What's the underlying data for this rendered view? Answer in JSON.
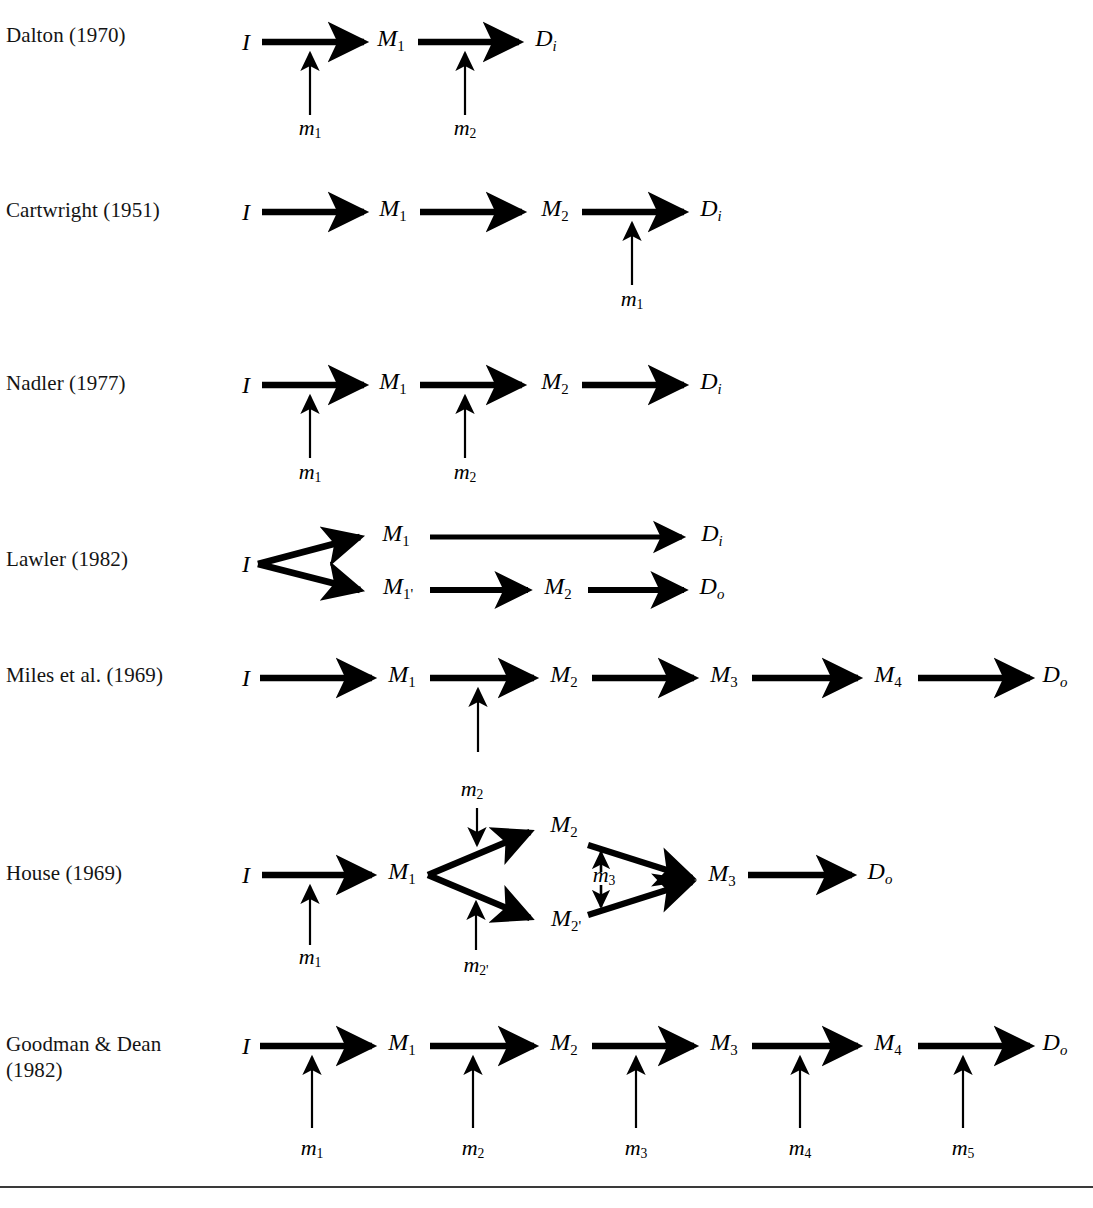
{
  "figure": {
    "type": "diagram",
    "arrow_color": "#000000",
    "text_color": "#000000",
    "background": "#ffffff"
  },
  "rows": [
    {
      "id": "dalton",
      "label": "Dalton (1970)",
      "nodes": [
        {
          "name": "I",
          "sub": ""
        },
        {
          "name": "M",
          "sub": "1"
        },
        {
          "name": "D",
          "sub": "i"
        }
      ],
      "mediators": [
        {
          "name": "m",
          "sub": "1"
        },
        {
          "name": "m",
          "sub": "2"
        }
      ]
    },
    {
      "id": "cartwright",
      "label": "Cartwright (1951)",
      "nodes": [
        {
          "name": "I",
          "sub": ""
        },
        {
          "name": "M",
          "sub": "1"
        },
        {
          "name": "M",
          "sub": "2"
        },
        {
          "name": "D",
          "sub": "i"
        }
      ],
      "mediators": [
        {
          "name": "m",
          "sub": "1"
        }
      ]
    },
    {
      "id": "nadler",
      "label": "Nadler (1977)",
      "nodes": [
        {
          "name": "I",
          "sub": ""
        },
        {
          "name": "M",
          "sub": "1"
        },
        {
          "name": "M",
          "sub": "2"
        },
        {
          "name": "D",
          "sub": "i"
        }
      ],
      "mediators": [
        {
          "name": "m",
          "sub": "1"
        },
        {
          "name": "m",
          "sub": "2"
        }
      ]
    },
    {
      "id": "lawler",
      "label": "Lawler (1982)",
      "nodes": [
        {
          "name": "I",
          "sub": ""
        },
        {
          "name": "M",
          "sub": "1"
        },
        {
          "name": "D",
          "sub": "i"
        },
        {
          "name": "M",
          "sub": "1'"
        },
        {
          "name": "M",
          "sub": "2"
        },
        {
          "name": "D",
          "sub": "o"
        }
      ],
      "mediators": []
    },
    {
      "id": "miles",
      "label": "Miles et al. (1969)",
      "nodes": [
        {
          "name": "I",
          "sub": ""
        },
        {
          "name": "M",
          "sub": "1"
        },
        {
          "name": "M",
          "sub": "2"
        },
        {
          "name": "M",
          "sub": "3"
        },
        {
          "name": "M",
          "sub": "4"
        },
        {
          "name": "D",
          "sub": "o"
        }
      ],
      "mediators": []
    },
    {
      "id": "house",
      "label": "House (1969)",
      "nodes": [
        {
          "name": "I",
          "sub": ""
        },
        {
          "name": "M",
          "sub": "1"
        },
        {
          "name": "M",
          "sub": "2"
        },
        {
          "name": "M",
          "sub": "2'"
        },
        {
          "name": "M",
          "sub": "3"
        },
        {
          "name": "D",
          "sub": "o"
        }
      ],
      "mediators": [
        {
          "name": "m",
          "sub": "1"
        },
        {
          "name": "m",
          "sub": "2"
        },
        {
          "name": "m",
          "sub": "2'"
        },
        {
          "name": "m",
          "sub": "3"
        }
      ]
    },
    {
      "id": "goodman-dean",
      "label": "Goodman & Dean\n(1982)",
      "nodes": [
        {
          "name": "I",
          "sub": ""
        },
        {
          "name": "M",
          "sub": "1"
        },
        {
          "name": "M",
          "sub": "2"
        },
        {
          "name": "M",
          "sub": "3"
        },
        {
          "name": "M",
          "sub": "4"
        },
        {
          "name": "D",
          "sub": "o"
        }
      ],
      "mediators": [
        {
          "name": "m",
          "sub": "1"
        },
        {
          "name": "m",
          "sub": "2"
        },
        {
          "name": "m",
          "sub": "3"
        },
        {
          "name": "m",
          "sub": "4"
        },
        {
          "name": "m",
          "sub": "5"
        }
      ]
    }
  ],
  "labels": {
    "dalton": "Dalton (1970)",
    "cartwright": "Cartwright (1951)",
    "nadler": "Nadler (1977)",
    "lawler": "Lawler (1982)",
    "miles": "Miles et al. (1969)",
    "house": "House (1969)",
    "goodman": "Goodman & Dean\n(1982)"
  },
  "glyphs": {
    "I": "I",
    "M": "M",
    "D": "D",
    "m": "m",
    "sub_1": "1",
    "sub_2": "2",
    "sub_3": "3",
    "sub_4": "4",
    "sub_5": "5",
    "sub_i": "i",
    "sub_o": "o",
    "sub_1p": "1'",
    "sub_2p": "2'"
  }
}
